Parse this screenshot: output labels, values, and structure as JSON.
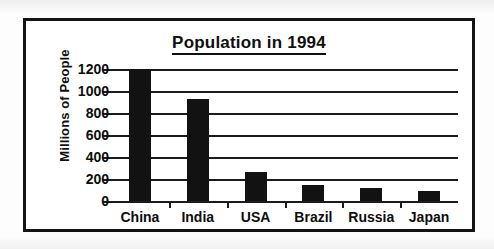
{
  "chart_data": {
    "type": "bar",
    "title": "Population in 1994",
    "xlabel": "",
    "ylabel": "Millions of People",
    "categories": [
      "China",
      "India",
      "USA",
      "Brazil",
      "Russia",
      "Japan"
    ],
    "values": [
      1200,
      930,
      260,
      150,
      120,
      95
    ],
    "ylim": [
      0,
      1200
    ],
    "yticks": [
      0,
      200,
      400,
      600,
      800,
      1000,
      1200
    ],
    "ytick_labels": [
      "0",
      "200",
      "400",
      "600",
      "800",
      "1000",
      "1200"
    ],
    "grid": true,
    "grid_axis": "y",
    "legend": false,
    "legend_position": "none",
    "bar_color": "#121212",
    "axis_color": "#1b1b1b",
    "background_color": "#ffffff",
    "title_underlined": true
  },
  "figure": {
    "border_color": "#141414",
    "page_background": "#fdfdfd"
  }
}
